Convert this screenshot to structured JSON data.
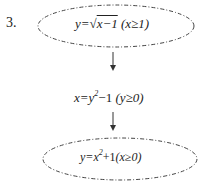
{
  "problem": {
    "number": "3.",
    "steps": [
      {
        "text": "y=√x−1 (x≥1)",
        "lhs": "y=",
        "radical": "√",
        "radicand": "x−1",
        "condition": "(x≥1)",
        "shape": "dashed-ellipse"
      },
      {
        "text": "x=y²−1 (y≥0)",
        "lhs": "x=y",
        "exp": "2",
        "rest": "−1",
        "condition": "(y≥0)",
        "shape": "none"
      },
      {
        "text": "y=x²+1(x≥0)",
        "lhs": "y=x",
        "exp": "2",
        "rest": "+1",
        "condition": "(x≥0)",
        "shape": "dashed-ellipse"
      }
    ],
    "arrows": [
      "down-arrow",
      "down-arrow"
    ],
    "colors": {
      "stroke": "#444444",
      "text": "#222222"
    }
  }
}
